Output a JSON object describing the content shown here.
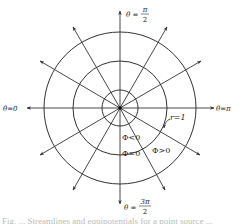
{
  "figure": {
    "center": [
      120,
      108
    ],
    "circles": [
      {
        "id": "inner",
        "radius": 18
      },
      {
        "id": "middle",
        "radius": 47,
        "label": "r=1"
      },
      {
        "id": "outer",
        "radius": 76
      }
    ],
    "rays": {
      "count": 12,
      "step_degrees": 30,
      "length": 94
    },
    "stroke_color": "#333333",
    "labels": {
      "top": {
        "prefix": "θ =",
        "numerator": "π",
        "denominator": "2"
      },
      "bottom": {
        "prefix": "θ =",
        "numerator": "3π",
        "denominator": "2"
      },
      "left": "θ=0",
      "right": "θ=π",
      "radius": "r=1",
      "phi_negative": "Φ<0",
      "phi_zero": "Φ=0",
      "phi_positive": "Φ>0"
    }
  },
  "caption": "Fig. ... Streamlines and equipotentials for a point source ..."
}
